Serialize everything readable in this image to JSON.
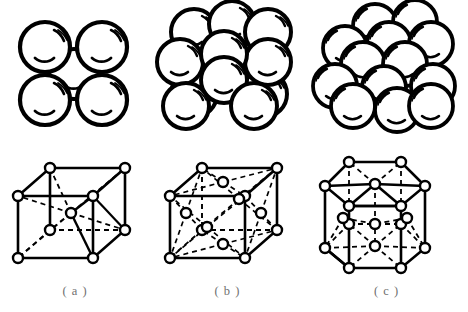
{
  "figure": {
    "background_color": "#ffffff",
    "line_color": "#000000",
    "caption_color": "#6f6f6f",
    "node_fill": "#ffffff"
  },
  "panels": [
    {
      "key": "a",
      "caption": "( a )",
      "structure_name": "body-centered cubic",
      "abbreviation": "BCC",
      "sphere_model": {
        "name": "bcc-sphere-packing",
        "sphere_count": 5,
        "sphere_radius": 25,
        "spheres": [
          {
            "cx": 45,
            "cy": 45,
            "r": 25,
            "layer": "front"
          },
          {
            "cx": 102,
            "cy": 45,
            "r": 25,
            "layer": "front"
          },
          {
            "cx": 45,
            "cy": 98,
            "r": 25,
            "layer": "front"
          },
          {
            "cx": 102,
            "cy": 98,
            "r": 25,
            "layer": "front"
          },
          {
            "cx": 74,
            "cy": 72,
            "r": 25,
            "layer": "center"
          }
        ]
      },
      "lattice": {
        "name": "bcc-unit-cell",
        "node_radius": 5,
        "corner_nodes": 8,
        "interior_nodes": 1,
        "nodes": [
          {
            "x": 18,
            "y": 56,
            "id": "front-top-left"
          },
          {
            "x": 93,
            "y": 56,
            "id": "back-top-right-proj"
          },
          {
            "x": 50,
            "y": 28,
            "id": "back-top-left"
          },
          {
            "x": 125,
            "y": 28,
            "id": "back-top-right"
          },
          {
            "x": 18,
            "y": 118,
            "id": "front-bottom-left"
          },
          {
            "x": 93,
            "y": 118,
            "id": "front-bottom-right"
          },
          {
            "x": 50,
            "y": 90,
            "id": "back-bottom-left"
          },
          {
            "x": 125,
            "y": 90,
            "id": "back-bottom-right"
          },
          {
            "x": 71,
            "y": 73,
            "id": "body-center"
          }
        ]
      }
    },
    {
      "key": "b",
      "caption": "( b )",
      "structure_name": "face-centered cubic",
      "abbreviation": "FCC",
      "sphere_model": {
        "name": "fcc-sphere-packing",
        "sphere_count": 14,
        "sphere_radius": 23,
        "spheres": [
          {
            "cx": 44,
            "cy": 30,
            "r": 23,
            "layer": "back"
          },
          {
            "cx": 82,
            "cy": 22,
            "r": 23,
            "layer": "back"
          },
          {
            "cx": 118,
            "cy": 30,
            "r": 23,
            "layer": "back"
          },
          {
            "cx": 30,
            "cy": 60,
            "r": 23,
            "layer": "mid"
          },
          {
            "cx": 118,
            "cy": 60,
            "r": 23,
            "layer": "mid"
          },
          {
            "cx": 74,
            "cy": 52,
            "r": 23,
            "layer": "front-top"
          },
          {
            "cx": 44,
            "cy": 92,
            "r": 23,
            "layer": "back"
          },
          {
            "cx": 114,
            "cy": 92,
            "r": 23,
            "layer": "back"
          },
          {
            "cx": 74,
            "cy": 78,
            "r": 23,
            "layer": "center"
          },
          {
            "cx": 36,
            "cy": 104,
            "r": 23,
            "layer": "front"
          },
          {
            "cx": 104,
            "cy": 104,
            "r": 23,
            "layer": "front"
          }
        ]
      },
      "lattice": {
        "name": "fcc-unit-cell",
        "node_radius": 5,
        "corner_nodes": 8,
        "face_center_nodes": 6,
        "nodes": [
          {
            "x": 20,
            "y": 56,
            "id": "front-top-left"
          },
          {
            "x": 95,
            "y": 56,
            "id": "front-top-right"
          },
          {
            "x": 52,
            "y": 28,
            "id": "back-top-left"
          },
          {
            "x": 127,
            "y": 28,
            "id": "back-top-right"
          },
          {
            "x": 20,
            "y": 118,
            "id": "front-bottom-left"
          },
          {
            "x": 95,
            "y": 118,
            "id": "front-bottom-right"
          },
          {
            "x": 52,
            "y": 90,
            "id": "back-bottom-left"
          },
          {
            "x": 127,
            "y": 90,
            "id": "back-bottom-right"
          },
          {
            "x": 57,
            "y": 87,
            "id": "front-face-center"
          },
          {
            "x": 89,
            "y": 59,
            "id": "back-face-center"
          },
          {
            "x": 36,
            "y": 73,
            "id": "left-face-center"
          },
          {
            "x": 111,
            "y": 73,
            "id": "right-face-center"
          },
          {
            "x": 73,
            "y": 42,
            "id": "top-face-center"
          },
          {
            "x": 73,
            "y": 104,
            "id": "bottom-face-center"
          }
        ]
      }
    },
    {
      "key": "c",
      "caption": "( c )",
      "structure_name": "hexagonal close-packed",
      "abbreviation": "HCP",
      "sphere_model": {
        "name": "hcp-sphere-packing",
        "sphere_count": 17,
        "sphere_radius": 22,
        "spheres": [
          {
            "cx": 70,
            "cy": 24,
            "r": 22,
            "layer": "back-top"
          },
          {
            "cx": 110,
            "cy": 20,
            "r": 22,
            "layer": "back-top"
          },
          {
            "cx": 40,
            "cy": 46,
            "r": 22,
            "layer": "back"
          },
          {
            "cx": 84,
            "cy": 42,
            "r": 22,
            "layer": "back"
          },
          {
            "cx": 126,
            "cy": 42,
            "r": 22,
            "layer": "back"
          },
          {
            "cx": 58,
            "cy": 62,
            "r": 22,
            "layer": "mid"
          },
          {
            "cx": 100,
            "cy": 62,
            "r": 22,
            "layer": "mid"
          },
          {
            "cx": 30,
            "cy": 84,
            "r": 22,
            "layer": "mid"
          },
          {
            "cx": 128,
            "cy": 84,
            "r": 22,
            "layer": "mid"
          },
          {
            "cx": 79,
            "cy": 86,
            "r": 22,
            "layer": "center"
          },
          {
            "cx": 48,
            "cy": 104,
            "r": 22,
            "layer": "front"
          },
          {
            "cx": 92,
            "cy": 108,
            "r": 22,
            "layer": "front"
          },
          {
            "cx": 126,
            "cy": 104,
            "r": 22,
            "layer": "front"
          }
        ]
      },
      "lattice": {
        "name": "hcp-unit-cell",
        "node_radius": 5,
        "hexagon_corner_nodes": 12,
        "hexagon_center_nodes": 2,
        "midplane_nodes": 3,
        "nodes": [
          {
            "x": 20,
            "y": 46,
            "id": "top-hex-left"
          },
          {
            "x": 44,
            "y": 22,
            "id": "top-hex-back-left"
          },
          {
            "x": 96,
            "y": 22,
            "id": "top-hex-back-right"
          },
          {
            "x": 120,
            "y": 46,
            "id": "top-hex-right"
          },
          {
            "x": 96,
            "y": 66,
            "id": "top-hex-front-right"
          },
          {
            "x": 44,
            "y": 66,
            "id": "top-hex-front-left"
          },
          {
            "x": 70,
            "y": 44,
            "id": "top-hex-center"
          },
          {
            "x": 20,
            "y": 108,
            "id": "bottom-hex-left"
          },
          {
            "x": 44,
            "y": 84,
            "id": "bottom-hex-back-left"
          },
          {
            "x": 96,
            "y": 84,
            "id": "bottom-hex-back-right"
          },
          {
            "x": 120,
            "y": 108,
            "id": "bottom-hex-right"
          },
          {
            "x": 96,
            "y": 128,
            "id": "bottom-hex-front-right"
          },
          {
            "x": 44,
            "y": 128,
            "id": "bottom-hex-front-left"
          },
          {
            "x": 70,
            "y": 106,
            "id": "bottom-hex-center"
          },
          {
            "x": 38,
            "y": 78,
            "id": "midplane-left"
          },
          {
            "x": 102,
            "y": 78,
            "id": "midplane-right"
          },
          {
            "x": 70,
            "y": 84,
            "id": "midplane-center"
          }
        ]
      }
    }
  ]
}
